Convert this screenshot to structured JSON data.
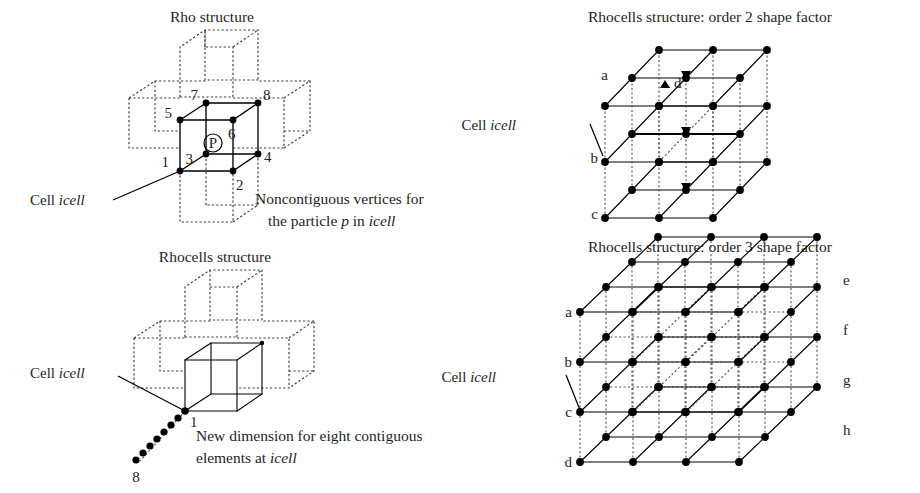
{
  "figure": {
    "background": "#ffffff",
    "ink": "#231f20",
    "panels": [
      {
        "id": "rho",
        "title": "Rho structure",
        "title_pos": [
          212,
          22
        ],
        "cell_label": "Cell ",
        "cell_label_italic": "icell",
        "cell_label_pos": [
          30,
          205
        ],
        "caption_line1": "Noncontiguous vertices for",
        "caption_line2_pre": "the particle ",
        "caption_line2_ital1": "p",
        "caption_line2_mid": " in ",
        "caption_line2_ital2": "icell",
        "caption_pos": [
          255,
          204
        ],
        "vertex_labels": [
          "1",
          "2",
          "3",
          "4",
          "5",
          "6",
          "7",
          "8"
        ],
        "particle_label": "P"
      },
      {
        "id": "rhocells",
        "title": "Rhocells structure",
        "title_pos": [
          215,
          262
        ],
        "cell_label": "Cell ",
        "cell_label_italic": "icell",
        "cell_label_pos": [
          30,
          378
        ],
        "caption_line1": "New dimension for eight contiguous",
        "caption_line2_pre": "elements at ",
        "caption_line2_ital": "icell",
        "caption_pos": [
          196,
          441
        ],
        "chain_start_label": "1",
        "chain_end_label": "8",
        "chain_count": 8
      },
      {
        "id": "order2",
        "title": "Rhocells structure: order 2 shape factor",
        "title_pos": [
          710,
          22
        ],
        "cell_label": "Cell ",
        "cell_label_italic": "icell",
        "cell_label_pos": [
          516,
          130
        ],
        "corner_labels": [
          "a",
          "b",
          "c"
        ],
        "marker_label": "d",
        "order": 2,
        "nodes_per_edge": 3
      },
      {
        "id": "order3",
        "title": "Rhocells structure: order 3 shape factor",
        "title_pos": [
          710,
          252
        ],
        "cell_label": "Cell ",
        "cell_label_italic": "icell",
        "cell_label_pos": [
          496,
          382
        ],
        "left_labels": [
          "a",
          "b",
          "c",
          "d"
        ],
        "right_labels": [
          "e",
          "f",
          "g",
          "h"
        ],
        "order": 3,
        "nodes_per_edge": 4
      }
    ]
  }
}
